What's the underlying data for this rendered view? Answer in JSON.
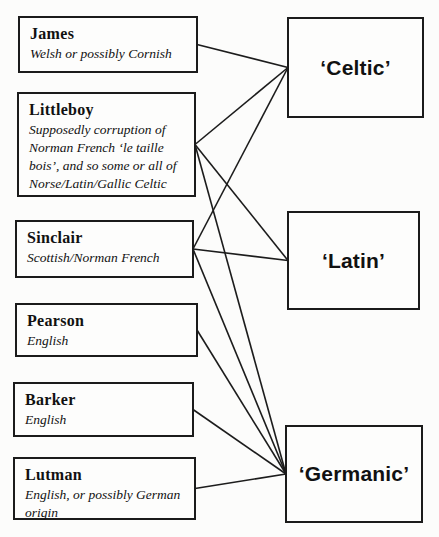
{
  "diagram": {
    "left_nodes": [
      {
        "id": "james",
        "name": "James",
        "description": "Welsh or possibly Cornish"
      },
      {
        "id": "littleboy",
        "name": "Littleboy",
        "description": "Supposedly corruption of Norman French ‘le taille bois’, and so some or all of Norse/Latin/Gallic Celtic"
      },
      {
        "id": "sinclair",
        "name": "Sinclair",
        "description": "Scottish/Norman French"
      },
      {
        "id": "pearson",
        "name": "Pearson",
        "description": "English"
      },
      {
        "id": "barker",
        "name": "Barker",
        "description": "English"
      },
      {
        "id": "lutman",
        "name": "Lutman",
        "description": "English, or possibly German origin"
      }
    ],
    "right_nodes": [
      {
        "id": "celtic",
        "label": "‘Celtic’"
      },
      {
        "id": "latin",
        "label": "‘Latin’"
      },
      {
        "id": "germanic",
        "label": "‘Germanic’"
      }
    ],
    "connections": [
      [
        "james",
        "celtic"
      ],
      [
        "littleboy",
        "celtic"
      ],
      [
        "littleboy",
        "latin"
      ],
      [
        "littleboy",
        "germanic"
      ],
      [
        "sinclair",
        "celtic"
      ],
      [
        "sinclair",
        "latin"
      ],
      [
        "sinclair",
        "germanic"
      ],
      [
        "pearson",
        "germanic"
      ],
      [
        "barker",
        "germanic"
      ],
      [
        "lutman",
        "germanic"
      ]
    ],
    "colors": {
      "line": "#1c1c1c",
      "border": "#1b1b1b",
      "text": "#111111",
      "background": "#fcfcfb"
    }
  }
}
